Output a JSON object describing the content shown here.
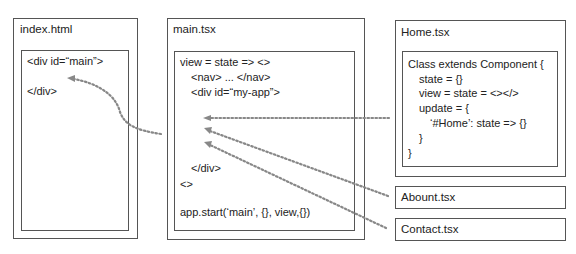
{
  "index_file": {
    "title": "index.html",
    "lines": [
      "<div id=“main”>",
      "</div>"
    ]
  },
  "main_file": {
    "title": "main.tsx",
    "lines": [
      "view = state => <>",
      "<nav> ... </nav>",
      "<div id=“my-app”>",
      "</div>",
      "<>",
      "app.start(‘main’, {}, view,{})"
    ]
  },
  "home_file": {
    "title": "Home.tsx",
    "lines": [
      "Class extends Component {",
      "state = {}",
      "view = state = <></>",
      "update = {",
      "‘#Home’: state => {}",
      "}",
      "}"
    ]
  },
  "about_file": {
    "title": "Abount.tsx"
  },
  "contact_file": {
    "title": "Contact.tsx"
  },
  "colors": {
    "border": "#555555",
    "arrow": "#888888",
    "text": "#222222"
  }
}
